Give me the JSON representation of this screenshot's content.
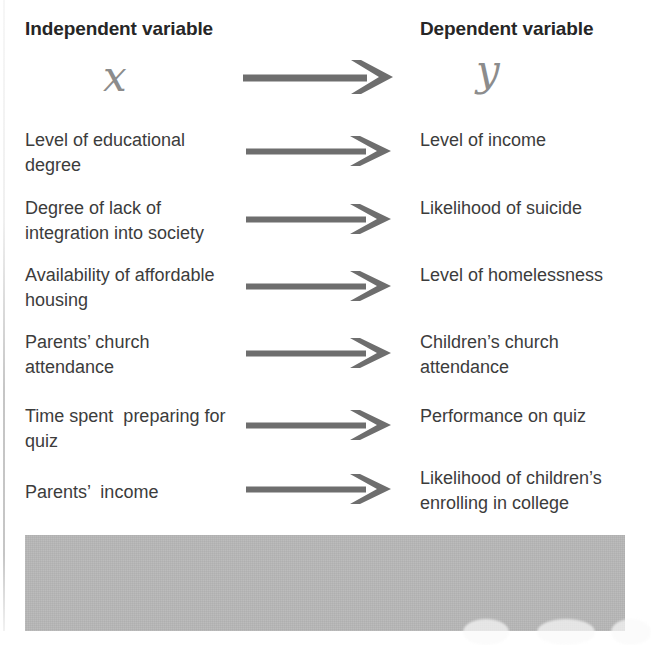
{
  "diagram": {
    "headers": {
      "independent_label": "Independent variable",
      "dependent_label": "Dependent variable",
      "independent_symbol": "x",
      "dependent_symbol": "y",
      "header_arrow": "arrow-right"
    },
    "rows": [
      {
        "independent": "Level of educational degree",
        "arrow": "arrow-right",
        "dependent": "Level of income"
      },
      {
        "independent": "Degree of lack of integration into society",
        "arrow": "arrow-right",
        "dependent": "Likelihood of suicide"
      },
      {
        "independent": "Availability of affordable housing",
        "arrow": "arrow-right",
        "dependent": "Level of homelessness"
      },
      {
        "independent": "Parents’ church attendance",
        "arrow": "arrow-right",
        "dependent": "Children’s church attendance"
      },
      {
        "independent": "Time spent  preparing for quiz",
        "arrow": "arrow-right",
        "dependent": "Performance on quiz"
      },
      {
        "independent": "Parents’  income",
        "arrow": "arrow-right",
        "dependent": "Likelihood of children’s enrolling in college"
      }
    ],
    "colors": {
      "header_text": "#262626",
      "body_text": "#3c3c3c",
      "symbol": "#8c8c8c",
      "arrow": "#6e6e6e",
      "gray_block": "#b6b6b6",
      "background": "#ffffff"
    }
  }
}
